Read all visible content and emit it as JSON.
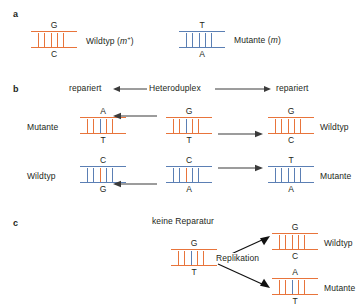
{
  "figure": {
    "panels": [
      "a",
      "b",
      "c"
    ]
  },
  "panel_a": {
    "letter": "a",
    "items": [
      {
        "duplex": {
          "top_base": "G",
          "bottom_base": "C",
          "rail_top_color": "#E8743B",
          "rail_bottom_color": "#E8743B",
          "rung_color": "#E8743B",
          "mid_rung_color": "#E8743B"
        },
        "label": "Wildtyp (",
        "label_italic": "m",
        "label_sup": "+",
        "label_tail": ")"
      },
      {
        "duplex": {
          "top_base": "T",
          "bottom_base": "A",
          "rail_top_color": "#5B7FB4",
          "rail_bottom_color": "#5B7FB4",
          "rung_color": "#5B7FB4",
          "mid_rung_color": "#5B7FB4"
        },
        "label": "Mutante (",
        "label_italic": "m",
        "label_sup": "",
        "label_tail": ")"
      }
    ]
  },
  "panel_b": {
    "letter": "b",
    "header": {
      "left": "repariert",
      "center": "Heteroduplex",
      "right": "repariert"
    },
    "row_top": {
      "left_label": "Mutante",
      "right_label": "Wildtyp",
      "left_duplex": {
        "top_base": "A",
        "bottom_base": "T",
        "rail_top_color": "#E8743B",
        "rail_bottom_color": "#E8743B",
        "rung_color": "#E8743B",
        "mid_rung_color": "#5B7FB4"
      },
      "center_duplex": {
        "top_base": "G",
        "bottom_base": "T",
        "rail_top_color": "#E8743B",
        "rail_bottom_color": "#E8743B",
        "rung_color": "#E8743B",
        "mid_rung_color": "#5B7FB4"
      },
      "right_duplex": {
        "top_base": "G",
        "bottom_base": "C",
        "rail_top_color": "#E8743B",
        "rail_bottom_color": "#E8743B",
        "rung_color": "#E8743B",
        "mid_rung_color": "#E8743B"
      }
    },
    "row_bottom": {
      "left_label": "Wildtyp",
      "right_label": "Mutante",
      "left_duplex": {
        "top_base": "C",
        "bottom_base": "G",
        "rail_top_color": "#5B7FB4",
        "rail_bottom_color": "#5B7FB4",
        "rung_color": "#5B7FB4",
        "mid_rung_color": "#E8743B"
      },
      "center_duplex": {
        "top_base": "C",
        "bottom_base": "A",
        "rail_top_color": "#5B7FB4",
        "rail_bottom_color": "#5B7FB4",
        "rung_color": "#5B7FB4",
        "mid_rung_color": "#E8743B"
      },
      "right_duplex": {
        "top_base": "T",
        "bottom_base": "A",
        "rail_top_color": "#5B7FB4",
        "rail_bottom_color": "#5B7FB4",
        "rung_color": "#5B7FB4",
        "mid_rung_color": "#5B7FB4"
      }
    }
  },
  "panel_c": {
    "letter": "c",
    "title": "keine Reparatur",
    "process_label": "Replikation",
    "source_duplex": {
      "top_base": "G",
      "bottom_base": "T",
      "rail_top_color": "#E8743B",
      "rail_bottom_color": "#E8743B",
      "rung_color": "#E8743B",
      "mid_rung_color": "#5B7FB4"
    },
    "product_top": {
      "label": "Wildtyp",
      "duplex": {
        "top_base": "G",
        "bottom_base": "C",
        "rail_top_color": "#E8743B",
        "rail_bottom_color": "#E8743B",
        "rung_color": "#E8743B",
        "mid_rung_color": "#E8743B"
      }
    },
    "product_bottom": {
      "label": "Mutante",
      "duplex": {
        "top_base": "A",
        "bottom_base": "T",
        "rail_top_color": "#E8743B",
        "rail_bottom_color": "#E8743B",
        "rung_color": "#E8743B",
        "mid_rung_color": "#5B7FB4"
      }
    }
  },
  "colors": {
    "orange": "#E8743B",
    "blue": "#5B7FB4",
    "text": "#231f20",
    "arrow": "#3b3b3b"
  }
}
